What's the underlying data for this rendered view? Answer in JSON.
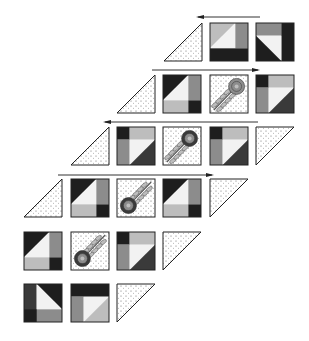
{
  "colors": {
    "black": "#1e1e1e",
    "dark": "#3a3a3a",
    "mid": "#8c8c8c",
    "light": "#bdbdbd",
    "white": "#f2f2f2",
    "outline": "#222222",
    "stipple": "#ffffff"
  },
  "rows": [
    {
      "y": 23,
      "arrow": {
        "x1": 198,
        "x2": 260,
        "y": 17,
        "dir": "left"
      },
      "pieces": [
        {
          "type": "tri-left",
          "x": 164
        },
        {
          "type": "A",
          "x": 210
        },
        {
          "type": "B",
          "x": 256
        }
      ]
    },
    {
      "y": 75,
      "arrow": {
        "x1": 152,
        "x2": 258,
        "y": 70,
        "dir": "right"
      },
      "pieces": [
        {
          "type": "tri-left",
          "x": 117
        },
        {
          "type": "C",
          "x": 163
        },
        {
          "type": "flower-up",
          "x": 210
        },
        {
          "type": "D",
          "x": 256
        }
      ]
    },
    {
      "y": 127,
      "arrow": {
        "x1": 105,
        "x2": 258,
        "y": 122,
        "dir": "left"
      },
      "pieces": [
        {
          "type": "tri-left",
          "x": 71
        },
        {
          "type": "D",
          "x": 117
        },
        {
          "type": "flower-up",
          "x": 163
        },
        {
          "type": "D",
          "x": 210
        },
        {
          "type": "tri-right",
          "x": 256
        }
      ]
    },
    {
      "y": 179,
      "arrow": {
        "x1": 58,
        "x2": 212,
        "y": 175,
        "dir": "right"
      },
      "pieces": [
        {
          "type": "tri-left",
          "x": 24
        },
        {
          "type": "C",
          "x": 71
        },
        {
          "type": "flower-down",
          "x": 117
        },
        {
          "type": "C",
          "x": 163
        },
        {
          "type": "tri-right",
          "x": 210
        }
      ]
    },
    {
      "y": 232,
      "arrow": null,
      "pieces": [
        {
          "type": "C",
          "x": 24
        },
        {
          "type": "flower-down",
          "x": 71
        },
        {
          "type": "D",
          "x": 117
        },
        {
          "type": "tri-right",
          "x": 163
        }
      ]
    },
    {
      "y": 284,
      "arrow": null,
      "pieces": [
        {
          "type": "E",
          "x": 24
        },
        {
          "type": "F",
          "x": 71
        },
        {
          "type": "tri-right",
          "x": 117
        }
      ]
    }
  ],
  "block_size": 38
}
